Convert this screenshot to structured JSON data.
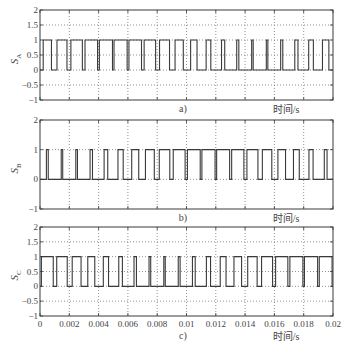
{
  "figure": {
    "xlabel": "时间/s",
    "panel_labels": [
      "a)",
      "b)",
      "c)"
    ]
  },
  "chart_data": [
    {
      "type": "line",
      "panel": "a)",
      "title": "",
      "ylabel": "S_A",
      "ylabel_main": "S",
      "ylabel_sub": "A",
      "xlabel": "时间/s",
      "xlim": [
        0,
        0.02
      ],
      "ylim": [
        -1,
        2
      ],
      "yticks": [
        -1,
        -0.5,
        0,
        0.5,
        1,
        1.5,
        2
      ],
      "ytick_labels": [
        "−1",
        "−0.5",
        "0",
        "0.5",
        "1",
        "1.5",
        "2"
      ],
      "xticks": [
        0,
        0.002,
        0.004,
        0.006,
        0.008,
        0.01,
        0.012,
        0.014,
        0.016,
        0.018,
        0.02
      ],
      "xtick_labels_shown": false,
      "grid": true,
      "signal": {
        "kind": "pwm",
        "levels": [
          0,
          1
        ],
        "carrier_period": 0.001,
        "mod_freq": 50,
        "mod_index": 0.8,
        "phase_deg": 0
      }
    },
    {
      "type": "line",
      "panel": "b)",
      "title": "",
      "ylabel": "S_B",
      "ylabel_main": "S",
      "ylabel_sub": "B",
      "xlabel": "时间/s",
      "xlim": [
        0,
        0.02
      ],
      "ylim": [
        -1,
        2
      ],
      "yticks": [
        -1,
        0,
        1,
        2
      ],
      "ytick_labels": [
        "−1",
        "0",
        "1",
        "2"
      ],
      "xticks": [
        0,
        0.002,
        0.004,
        0.006,
        0.008,
        0.01,
        0.012,
        0.014,
        0.016,
        0.018,
        0.02
      ],
      "xtick_labels_shown": false,
      "grid": true,
      "signal": {
        "kind": "pwm",
        "levels": [
          0,
          1
        ],
        "carrier_period": 0.001,
        "mod_freq": 50,
        "mod_index": 0.8,
        "phase_deg": -120
      }
    },
    {
      "type": "line",
      "panel": "c)",
      "title": "",
      "ylabel": "S_C",
      "ylabel_main": "S",
      "ylabel_sub": "C",
      "xlabel": "时间/s",
      "xlim": [
        0,
        0.02
      ],
      "ylim": [
        -1,
        2
      ],
      "yticks": [
        -1,
        -0.5,
        0,
        0.5,
        1,
        1.5,
        2
      ],
      "ytick_labels": [
        "−1",
        "−0.5",
        "0",
        "0.5",
        "1",
        "1.5",
        "2"
      ],
      "xticks": [
        0,
        0.002,
        0.004,
        0.006,
        0.008,
        0.01,
        0.012,
        0.014,
        0.016,
        0.018,
        0.02
      ],
      "xtick_labels": [
        "0",
        "0.002",
        "0.004",
        "0.006",
        "0.008",
        "0.01",
        "0.012",
        "0.014",
        "0.016",
        "0.018",
        "0.02"
      ],
      "xtick_labels_shown": true,
      "grid": true,
      "signal": {
        "kind": "pwm",
        "levels": [
          0,
          1
        ],
        "carrier_period": 0.001,
        "mod_freq": 50,
        "mod_index": 0.8,
        "phase_deg": 120
      }
    }
  ],
  "colors": {
    "line": "#3a3a3a",
    "axes": "#3a3a3a",
    "grid": "#777777",
    "background": "#ffffff"
  }
}
